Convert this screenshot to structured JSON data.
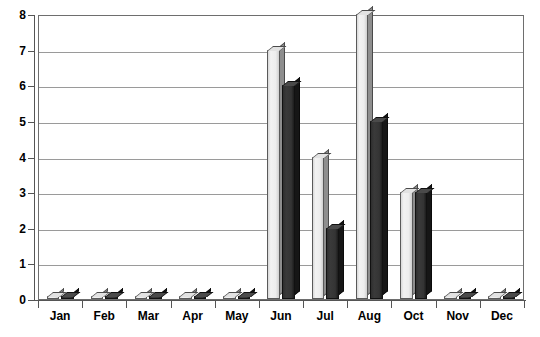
{
  "chart_data": {
    "type": "bar",
    "title": "",
    "subtitle": "",
    "xlabel": "",
    "ylabel": "",
    "ylim": [
      0,
      8
    ],
    "ytick_step": 1,
    "ytick_labels": [
      "0",
      "1",
      "2",
      "3",
      "4",
      "5",
      "6",
      "7",
      "8"
    ],
    "grid": true,
    "legend": false,
    "legend_position": "none",
    "categories": [
      "Jan",
      "Feb",
      "Mar",
      "Apr",
      "May",
      "Jun",
      "Jul",
      "Aug",
      "Oct",
      "Nov",
      "Dec"
    ],
    "series": [
      {
        "name": "Series 1",
        "color": "#ededed",
        "values": [
          0,
          0,
          0,
          0,
          0,
          7,
          4,
          8,
          3,
          0,
          0
        ]
      },
      {
        "name": "Series 2",
        "color": "#333333",
        "values": [
          0,
          0,
          0,
          0,
          0,
          6,
          2,
          5,
          3,
          0,
          0
        ]
      }
    ],
    "annotations": [],
    "style": {
      "bar_3d": true,
      "plot_border_color": "#6e6e6e",
      "gridline_color": "#9a9a9a",
      "axis_color": "#555555",
      "text_color": "#000000",
      "background": "#ffffff"
    }
  }
}
